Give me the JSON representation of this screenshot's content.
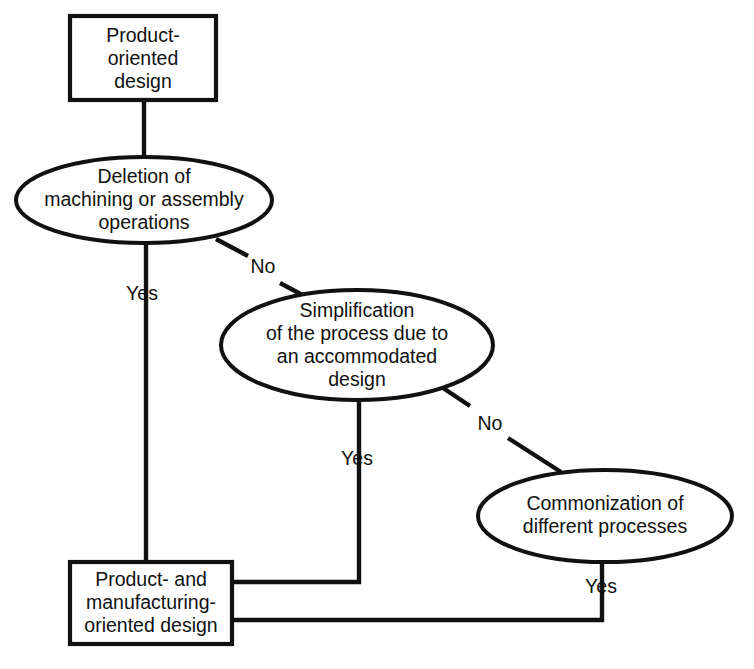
{
  "diagram": {
    "type": "flowchart",
    "title": "",
    "background_color": "#ffffff",
    "line_color": "#111111",
    "text_color": "#111111",
    "nodes": [
      {
        "id": "product-oriented-design",
        "shape": "rectangle",
        "lines": [
          "Product-",
          "oriented",
          "design"
        ],
        "text": "Product-oriented design"
      },
      {
        "id": "deletion-of-operations",
        "shape": "ellipse",
        "lines": [
          "Deletion of",
          "machining or assembly",
          "operations"
        ],
        "text": "Deletion of machining or assembly operations"
      },
      {
        "id": "simplification-of-process",
        "shape": "ellipse",
        "lines": [
          "Simplification",
          "of the process due to",
          "an accommodated",
          "design"
        ],
        "text": "Simplification of the process due to an accommodated design"
      },
      {
        "id": "commonization-of-processes",
        "shape": "ellipse",
        "lines": [
          "Commonization of",
          "different processes"
        ],
        "text": "Commonization of different processes"
      },
      {
        "id": "product-and-manufacturing-oriented-design",
        "shape": "rectangle",
        "lines": [
          "Product- and",
          "manufacturing-",
          "oriented design"
        ],
        "text": "Product- and manufacturing-oriented design"
      }
    ],
    "edges": [
      {
        "id": "edge-start",
        "from": "product-oriented-design",
        "to": "deletion-of-operations",
        "label": ""
      },
      {
        "id": "edge-deletion-yes",
        "from": "deletion-of-operations",
        "to": "product-and-manufacturing-oriented-design",
        "label": "Yes"
      },
      {
        "id": "edge-deletion-no",
        "from": "deletion-of-operations",
        "to": "simplification-of-process",
        "label": "No"
      },
      {
        "id": "edge-simplification-yes",
        "from": "simplification-of-process",
        "to": "product-and-manufacturing-oriented-design",
        "label": "Yes"
      },
      {
        "id": "edge-simplification-no",
        "from": "simplification-of-process",
        "to": "commonization-of-processes",
        "label": "No"
      },
      {
        "id": "edge-commonization-yes",
        "from": "commonization-of-processes",
        "to": "product-and-manufacturing-oriented-design",
        "label": "Yes"
      }
    ]
  }
}
